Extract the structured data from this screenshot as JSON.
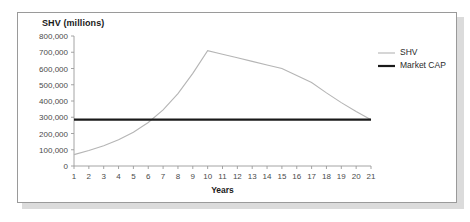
{
  "panel": {
    "border_color": "#9a9a9a",
    "background": "#ffffff",
    "shadow_color": "#bdbdbd"
  },
  "chart_data": {
    "type": "line",
    "title": "SHV (millions)",
    "xlabel": "Years",
    "ylabel": "",
    "xlim": [
      1,
      21
    ],
    "ylim": [
      0,
      800000
    ],
    "grid": false,
    "legend_position": "right",
    "y_ticks": [
      0,
      100000,
      200000,
      300000,
      400000,
      500000,
      600000,
      700000,
      800000
    ],
    "y_tick_labels": [
      "0",
      "100,000",
      "200,000",
      "300,000",
      "400,000",
      "500,000",
      "600,000",
      "700,000",
      "800,000"
    ],
    "x": [
      1,
      2,
      3,
      4,
      5,
      6,
      7,
      8,
      9,
      10,
      11,
      12,
      13,
      14,
      15,
      16,
      17,
      18,
      19,
      20,
      21
    ],
    "x_tick_labels": [
      "1",
      "2",
      "3",
      "4",
      "5",
      "6",
      "7",
      "8",
      "9",
      "10",
      "11",
      "12",
      "13",
      "14",
      "15",
      "16",
      "17",
      "18",
      "19",
      "20",
      "21"
    ],
    "series": [
      {
        "name": "SHV",
        "color": "#b5b5b5",
        "width": 1.1,
        "values": [
          70000,
          95000,
          125000,
          162000,
          208000,
          268000,
          345000,
          445000,
          570000,
          710000,
          688000,
          666000,
          644000,
          622000,
          600000,
          557000,
          514000,
          450000,
          390000,
          335000,
          285000
        ]
      },
      {
        "name": "Market CAP",
        "color": "#1a1a1a",
        "width": 2.2,
        "values": [
          285000,
          285000,
          285000,
          285000,
          285000,
          285000,
          285000,
          285000,
          285000,
          285000,
          285000,
          285000,
          285000,
          285000,
          285000,
          285000,
          285000,
          285000,
          285000,
          285000,
          285000
        ]
      }
    ],
    "legend": [
      {
        "label": "SHV",
        "color": "#b5b5b5",
        "width": 1.1
      },
      {
        "label": "Market CAP",
        "color": "#1a1a1a",
        "width": 2.2
      }
    ],
    "annotations": {
      "peak_year": 10,
      "peak_value": 710000,
      "crossover_year": 6
    }
  }
}
